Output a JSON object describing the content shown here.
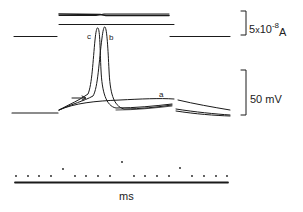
{
  "figure": {
    "type": "electrophysiology-oscilloscope-traces",
    "colors": {
      "ink": "#1a1a1a",
      "background": "#ffffff"
    },
    "current_panel": {
      "scale_bar": {
        "value": "5",
        "times": "x",
        "base": "10",
        "exponent": "-8",
        "unit": "A"
      }
    },
    "voltage_panel": {
      "traces": [
        {
          "id": "a",
          "label": "a",
          "description": "subthreshold response, no spike"
        },
        {
          "id": "b",
          "label": "b",
          "description": "action potential, later onset"
        },
        {
          "id": "c",
          "label": "c",
          "description": "action potential, earliest onset"
        }
      ],
      "arrow": {
        "description": "arrow marking threshold/inflection point"
      },
      "scale_bar": {
        "label": "50 mV"
      }
    },
    "time_marker": {
      "unit_label": "ms",
      "dot_count": 18,
      "raised_dot_positions_x": [
        63,
        122,
        180
      ]
    }
  }
}
